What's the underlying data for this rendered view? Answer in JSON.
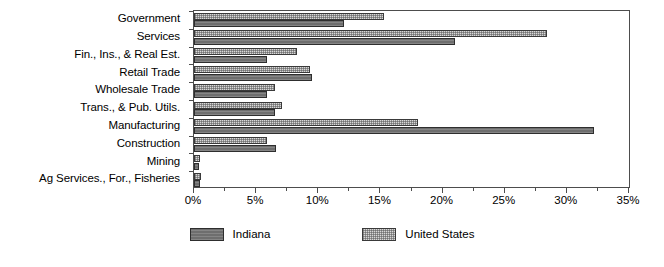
{
  "chart_data": {
    "type": "bar",
    "orientation": "horizontal",
    "title": "",
    "xlabel": "",
    "ylabel": "",
    "xlim": [
      0,
      35
    ],
    "xtick_labels": [
      "0%",
      "5%",
      "10%",
      "15%",
      "20%",
      "25%",
      "30%",
      "35%"
    ],
    "xtick_values": [
      0,
      5,
      10,
      15,
      20,
      25,
      30,
      35
    ],
    "minor_tick_interval": 2.5,
    "grid": false,
    "legend_position": "bottom",
    "categories": [
      "Government",
      "Services",
      "Fin., Ins., & Real Est.",
      "Retail Trade",
      "Wholesale Trade",
      "Trans., & Pub. Utils.",
      "Manufacturing",
      "Construction",
      "Mining",
      "Ag Services., For., Fisheries"
    ],
    "series": [
      {
        "name": "Indiana",
        "color": "#6e6e6e",
        "values": [
          12.1,
          21.0,
          5.9,
          9.5,
          5.9,
          6.5,
          32.2,
          6.6,
          0.4,
          0.5
        ]
      },
      {
        "name": "United States",
        "color": "#d8d8d8",
        "values": [
          15.3,
          28.4,
          8.3,
          9.3,
          6.5,
          7.1,
          18.0,
          5.9,
          0.5,
          0.6
        ]
      }
    ]
  },
  "legend": {
    "items": [
      {
        "label": "Indiana",
        "swatch": "dark-gray-solid"
      },
      {
        "label": "United States",
        "swatch": "light-gray-dotted"
      }
    ]
  }
}
